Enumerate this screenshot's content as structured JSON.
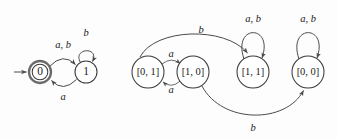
{
  "figure": {
    "title": "",
    "background_color": "#fdfdfd",
    "stroke_color": "#4a4a4a",
    "text_color": "#1a1a1a"
  },
  "automata": [
    {
      "id": "left-automaton",
      "name": "two-state-nfa",
      "states": [
        {
          "id": "s0",
          "label": "0",
          "accepting": true,
          "start": true,
          "cx": 40,
          "cy": 72,
          "r": 11
        },
        {
          "id": "s1",
          "label": "1",
          "accepting": false,
          "start": false,
          "cx": 86,
          "cy": 72,
          "r": 11
        }
      ],
      "transitions": [
        {
          "id": "t0",
          "from": "s0",
          "to": "s1",
          "label": "a, b",
          "shape": "arc-top",
          "label_x": 63,
          "label_y": 46
        },
        {
          "id": "t1",
          "from": "s1",
          "to": "s0",
          "label": "a",
          "shape": "arc-bottom",
          "label_x": 63,
          "label_y": 97
        },
        {
          "id": "t2",
          "from": "s1",
          "to": "s1",
          "label": "b",
          "shape": "self-loop-top",
          "label_x": 86,
          "label_y": 33
        }
      ],
      "start_arrow": {
        "id": "start-arrow-left",
        "x1": 14,
        "y1": 72,
        "x2": 28,
        "y2": 72
      }
    },
    {
      "id": "right-automaton",
      "name": "subset-construction-dfa",
      "states": [
        {
          "id": "q01",
          "label": "[0, 1]",
          "accepting": false,
          "start": false,
          "cx": 148,
          "cy": 72,
          "r": 16
        },
        {
          "id": "q10",
          "label": "[1, 0]",
          "accepting": false,
          "start": false,
          "cx": 193,
          "cy": 72,
          "r": 16
        },
        {
          "id": "q11",
          "label": "[1, 1]",
          "accepting": false,
          "start": false,
          "cx": 253,
          "cy": 72,
          "r": 16
        },
        {
          "id": "q00",
          "label": "[0, 0]",
          "accepting": false,
          "start": false,
          "cx": 308,
          "cy": 72,
          "r": 16
        }
      ],
      "transitions": [
        {
          "id": "r0",
          "from": "q01",
          "to": "q10",
          "label": "a",
          "shape": "arc-top-short",
          "label_x": 171,
          "label_y": 56
        },
        {
          "id": "r1",
          "from": "q10",
          "to": "q01",
          "label": "a",
          "shape": "arc-bottom-short",
          "label_x": 171,
          "label_y": 90
        },
        {
          "id": "r2",
          "from": "q01",
          "to": "q11",
          "label": "b",
          "shape": "arc-long-top",
          "label_x": 200,
          "label_y": 30
        },
        {
          "id": "r3",
          "from": "q10",
          "to": "q00",
          "label": "b",
          "shape": "arc-long-bottom",
          "label_x": 253,
          "label_y": 128
        },
        {
          "id": "r4",
          "from": "q11",
          "to": "q11",
          "label": "a, b",
          "shape": "self-loop-top",
          "label_x": 253,
          "label_y": 19
        },
        {
          "id": "r5",
          "from": "q00",
          "to": "q00",
          "label": "a, b",
          "shape": "self-loop-top",
          "label_x": 308,
          "label_y": 19
        }
      ],
      "start_arrow": null
    }
  ]
}
